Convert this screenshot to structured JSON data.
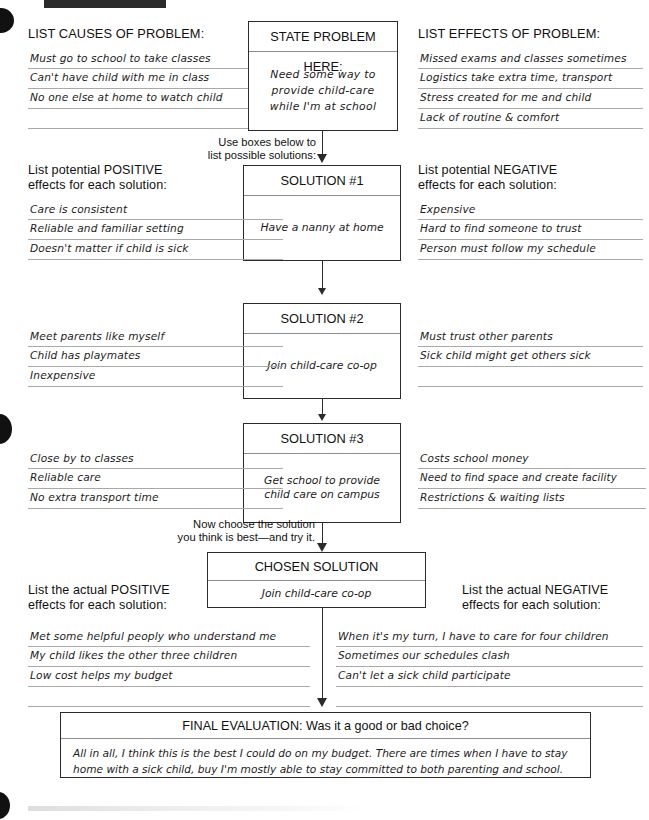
{
  "worksheet": {
    "top_section": {
      "causes_heading": "LIST CAUSES OF PROBLEM:",
      "problem_title": "STATE PROBLEM HERE:",
      "problem_text": "Need some way to\nprovide  child-care\nwhile I'm at school",
      "effects_heading": "LIST EFFECTS OF PROBLEM:",
      "causes": [
        "Must go to school to take classes",
        "Can't have child with me in class",
        "No one else at home to watch child",
        ""
      ],
      "effects": [
        "Missed exams and classes sometimes",
        "Logistics take extra time, transport",
        "Stress created for me and child",
        "Lack of routine & comfort"
      ]
    },
    "instruction_solutions": "Use boxes below to\nlist possible solutions:",
    "instruction_choose": "Now choose the solution\nyou think is best—and try it.",
    "potential_positive_heading": "List potential POSITIVE\neffects for each solution:",
    "potential_negative_heading": "List potential NEGATIVE\neffects for each solution:",
    "actual_positive_heading": "List the actual POSITIVE\neffects for each solution:",
    "actual_negative_heading": "List the actual NEGATIVE\neffects for each solution:",
    "solutions": [
      {
        "title": "SOLUTION #1",
        "text": "Have a nanny at home",
        "positives": [
          "Care is consistent",
          "Reliable and familiar setting",
          "Doesn't matter if child is sick"
        ],
        "negatives": [
          "Expensive",
          "Hard to find someone to trust",
          "Person must follow my schedule"
        ]
      },
      {
        "title": "SOLUTION #2",
        "text": "Join child-care co-op",
        "positives": [
          "Meet parents like myself",
          "Child has playmates",
          "Inexpensive"
        ],
        "negatives": [
          "Must trust other parents",
          "Sick child might get others sick",
          ""
        ]
      },
      {
        "title": "SOLUTION #3",
        "text": "Get school to provide\nchild care on campus",
        "positives": [
          "Close by to classes",
          "Reliable care",
          "No extra transport time"
        ],
        "negatives": [
          "Costs school money",
          "Need to find space and create facility",
          "Restrictions & waiting lists"
        ]
      }
    ],
    "chosen": {
      "title": "CHOSEN SOLUTION",
      "text": "Join child-care co-op",
      "positives": [
        "Met some helpful peoply who understand me",
        "My child likes the other three children",
        "Low cost helps my budget",
        ""
      ],
      "negatives": [
        "When it's my turn, I have to care for four children",
        "Sometimes our schedules clash",
        "Can't let a sick child participate",
        ""
      ]
    },
    "final": {
      "title": "FINAL EVALUATION: Was it a good or bad choice?",
      "text": "All in all, I think this is the best I could do on my budget. There are times when I have to stay home with a sick child, buy I'm mostly able to stay committed to both parenting and school."
    },
    "colors": {
      "ink": "#111111",
      "rule": "#a9a9a9",
      "box_border": "#2b2b2b"
    }
  }
}
